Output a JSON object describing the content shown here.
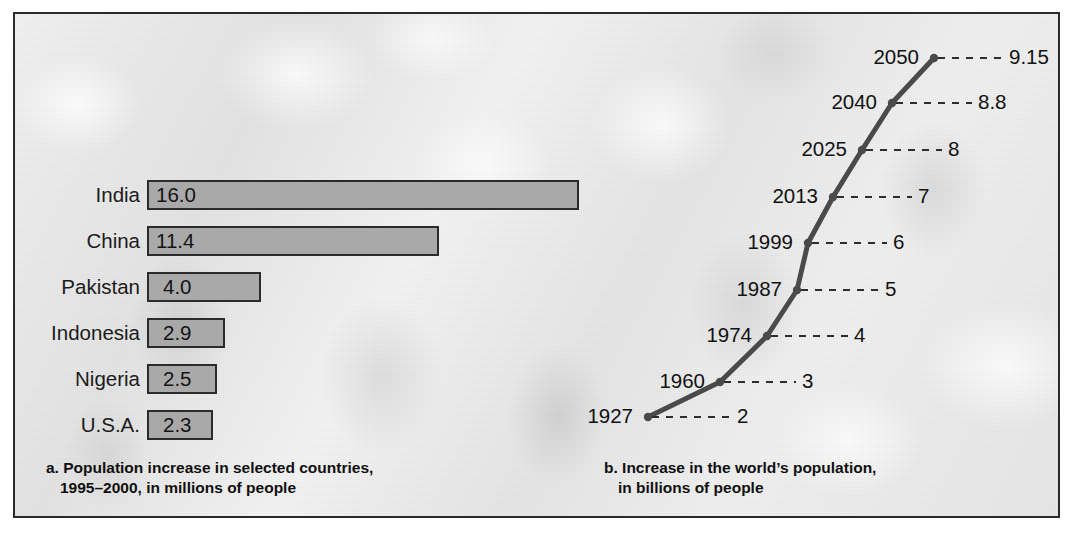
{
  "figure": {
    "border_color": "#2a2a2a",
    "background_note": "faded grayscale crowd photograph"
  },
  "chart_data": [
    {
      "type": "bar",
      "orientation": "horizontal",
      "title": "a. Population increase in selected countries, 1995–2000, in millions of people",
      "caption_line1": "a. Population increase in selected countries,",
      "caption_line2": "1995–2000, in millions of people",
      "xlabel": "",
      "ylabel": "",
      "unit": "millions of people",
      "period": "1995–2000",
      "grid": false,
      "legend": "none",
      "bar_fill": "#a9a9a9",
      "bar_border": "#2b2b2b",
      "categories": [
        "India",
        "China",
        "Pakistan",
        "Indonesia",
        "Nigeria",
        "U.S.A."
      ],
      "values": [
        16.0,
        11.4,
        4.0,
        2.9,
        2.5,
        2.3
      ],
      "value_labels": [
        "16.0",
        "11.4",
        "4.0",
        "2.9",
        "2.5",
        "2.3"
      ],
      "bars": [
        {
          "label": "India",
          "value": 16.0,
          "value_label": "16.0",
          "bar_px": 432,
          "top": 166
        },
        {
          "label": "China",
          "value": 11.4,
          "value_label": "11.4",
          "bar_px": 292,
          "top": 212
        },
        {
          "label": "Pakistan",
          "value": 4.0,
          "value_label": "4.0",
          "bar_px": 114,
          "top": 258
        },
        {
          "label": "Indonesia",
          "value": 2.9,
          "value_label": "2.9",
          "bar_px": 78,
          "top": 304
        },
        {
          "label": "Nigeria",
          "value": 2.5,
          "value_label": "2.5",
          "bar_px": 70,
          "top": 350
        },
        {
          "label": "U.S.A.",
          "value": 2.3,
          "value_label": "2.3",
          "bar_px": 66,
          "top": 396
        }
      ]
    },
    {
      "type": "line",
      "title": "b. Increase in the world's population, in billions of people",
      "caption_line1": "b. Increase in the world’s population,",
      "caption_line2": "in billions of people",
      "xlabel": "Year",
      "ylabel": "Population (billions)",
      "unit": "billions of people",
      "grid": false,
      "legend": "none",
      "line_color": "#4a4a4a",
      "x": [
        1927,
        1960,
        1974,
        1987,
        1999,
        2013,
        2025,
        2040,
        2050
      ],
      "y": [
        2,
        3,
        4,
        5,
        6,
        7,
        8,
        8.8,
        9.15
      ],
      "year_labels": [
        "1927",
        "1960",
        "1974",
        "1987",
        "1999",
        "2013",
        "2025",
        "2040",
        "2050"
      ],
      "value_labels": [
        "2",
        "3",
        "4",
        "5",
        "6",
        "7",
        "8",
        "8.8",
        "9.15"
      ],
      "points": [
        {
          "year": "1927",
          "value": "2",
          "px": 633,
          "py": 403,
          "year_right": 618,
          "dash_end": 716,
          "value_x": 722
        },
        {
          "year": "1960",
          "value": "3",
          "px": 705,
          "py": 368,
          "year_right": 690,
          "dash_end": 781,
          "value_x": 787
        },
        {
          "year": "1974",
          "value": "4",
          "px": 752,
          "py": 322,
          "year_right": 737,
          "dash_end": 833,
          "value_x": 839
        },
        {
          "year": "1987",
          "value": "5",
          "px": 782,
          "py": 276,
          "year_right": 767,
          "dash_end": 864,
          "value_x": 870
        },
        {
          "year": "1999",
          "value": "6",
          "px": 793,
          "py": 229,
          "year_right": 778,
          "dash_end": 872,
          "value_x": 878
        },
        {
          "year": "2013",
          "value": "7",
          "px": 818,
          "py": 183,
          "year_right": 803,
          "dash_end": 897,
          "value_x": 903
        },
        {
          "year": "2025",
          "value": "8",
          "px": 847,
          "py": 136,
          "year_right": 832,
          "dash_end": 927,
          "value_x": 933
        },
        {
          "year": "2040",
          "value": "8.8",
          "px": 877,
          "py": 89,
          "year_right": 862,
          "dash_end": 957,
          "value_x": 963
        },
        {
          "year": "2050",
          "value": "9.15",
          "px": 919,
          "py": 44,
          "year_right": 904,
          "dash_end": 988,
          "value_x": 994
        }
      ]
    }
  ]
}
